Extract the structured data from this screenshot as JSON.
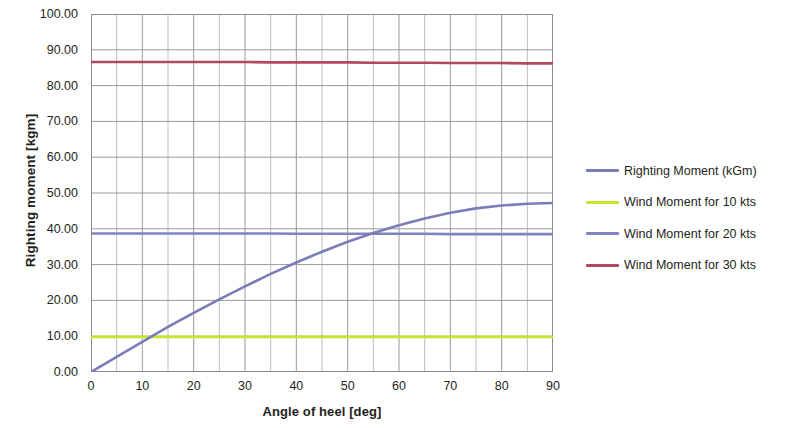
{
  "chart_data": {
    "type": "line",
    "title": "",
    "xlabel": "Angle of heel [deg]",
    "ylabel": "Righting moment [kgm]",
    "xlim": [
      0,
      90
    ],
    "ylim": [
      0,
      100
    ],
    "x_ticks": [
      "0",
      "10",
      "20",
      "30",
      "40",
      "50",
      "60",
      "70",
      "80",
      "90"
    ],
    "x_tick_values": [
      0,
      10,
      20,
      30,
      40,
      50,
      60,
      70,
      80,
      90
    ],
    "y_ticks": [
      "0.00",
      "10.00",
      "20.00",
      "30.00",
      "40.00",
      "50.00",
      "60.00",
      "70.00",
      "80.00",
      "90.00",
      "100.00"
    ],
    "y_tick_values": [
      0,
      10,
      20,
      30,
      40,
      50,
      60,
      70,
      80,
      90,
      100
    ],
    "grid": true,
    "minor_grid_x_step": 5,
    "legend_position": "right",
    "x": [
      0,
      5,
      10,
      15,
      20,
      25,
      30,
      35,
      40,
      45,
      50,
      55,
      60,
      65,
      70,
      75,
      80,
      85,
      90
    ],
    "series": [
      {
        "name": "Righting Moment (kGm)",
        "color": "#7b7cb8",
        "values": [
          0.0,
          4.2,
          8.4,
          12.6,
          16.5,
          20.3,
          23.9,
          27.4,
          30.6,
          33.6,
          36.4,
          38.8,
          41.0,
          42.9,
          44.5,
          45.7,
          46.5,
          47.0,
          47.2
        ]
      },
      {
        "name": "Wind Moment for 10 kts",
        "color": "#c4e62c",
        "values": [
          9.8,
          9.8,
          9.8,
          9.8,
          9.8,
          9.8,
          9.8,
          9.8,
          9.8,
          9.8,
          9.8,
          9.8,
          9.8,
          9.8,
          9.8,
          9.8,
          9.8,
          9.8,
          9.8
        ]
      },
      {
        "name": "Wind Moment for 20 kts",
        "color": "#8183c0",
        "values": [
          38.7,
          38.7,
          38.7,
          38.7,
          38.7,
          38.7,
          38.7,
          38.7,
          38.6,
          38.6,
          38.6,
          38.6,
          38.6,
          38.6,
          38.5,
          38.5,
          38.5,
          38.5,
          38.5
        ]
      },
      {
        "name": "Wind Moment for 30 kts",
        "color": "#b0495f",
        "values": [
          86.6,
          86.6,
          86.6,
          86.6,
          86.6,
          86.6,
          86.6,
          86.5,
          86.5,
          86.5,
          86.5,
          86.4,
          86.4,
          86.4,
          86.3,
          86.3,
          86.3,
          86.2,
          86.2
        ]
      }
    ]
  },
  "colors": {
    "righting_moment": "#7b7cb8",
    "wind_10kts": "#c4e62c",
    "wind_20kts": "#8183c0",
    "wind_30kts": "#b0495f",
    "gridline": "#9a9a9a",
    "minor_gridline": "#bdbdbd",
    "axis": "#8c8c8c",
    "text": "#231f20",
    "background": "#ffffff"
  },
  "legend": {
    "items": [
      {
        "label": "Righting Moment (kGm)",
        "color": "#7b7cb8"
      },
      {
        "label": "Wind Moment for 10 kts",
        "color": "#c4e62c"
      },
      {
        "label": "Wind Moment for 20 kts",
        "color": "#8183c0"
      },
      {
        "label": "Wind Moment for 30 kts",
        "color": "#b0495f"
      }
    ]
  }
}
